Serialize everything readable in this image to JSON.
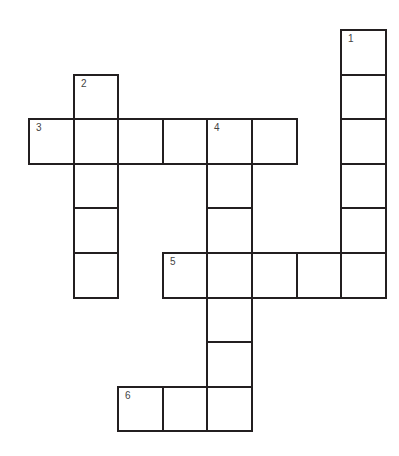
{
  "puzzle": {
    "type": "crossword",
    "cell_size": 44.6,
    "origin": {
      "x": 28,
      "y": 29
    },
    "colors": {
      "line": "#231f20",
      "cell_fill": "#ffffff",
      "number": "#444444"
    },
    "words": [
      {
        "number": "1",
        "direction": "down",
        "row": 0,
        "col": 7,
        "length": 6
      },
      {
        "number": "2",
        "direction": "down",
        "row": 1,
        "col": 1,
        "length": 5
      },
      {
        "number": "3",
        "direction": "across",
        "row": 2,
        "col": 0,
        "length": 6
      },
      {
        "number": "4",
        "direction": "down",
        "row": 2,
        "col": 4,
        "length": 7
      },
      {
        "number": "5",
        "direction": "across",
        "row": 5,
        "col": 3,
        "length": 5
      },
      {
        "number": "6",
        "direction": "across",
        "row": 8,
        "col": 2,
        "length": 3
      }
    ]
  }
}
